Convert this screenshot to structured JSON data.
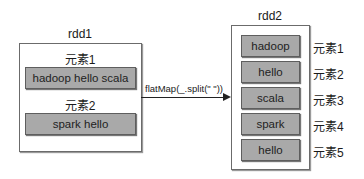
{
  "rdd1": {
    "title": "rdd1",
    "elements": [
      {
        "label": "元素1",
        "value": "hadoop hello scala"
      },
      {
        "label": "元素2",
        "value": "spark hello"
      }
    ]
  },
  "transformation": {
    "label": "flatMap(_.split(\" \"))"
  },
  "rdd2": {
    "title": "rdd2",
    "elements": [
      {
        "label": "元素1",
        "value": "hadoop"
      },
      {
        "label": "元素2",
        "value": "hello"
      },
      {
        "label": "元素3",
        "value": "scala"
      },
      {
        "label": "元素4",
        "value": "spark"
      },
      {
        "label": "元素5",
        "value": "hello"
      }
    ]
  },
  "colors": {
    "cell_fill": "#a9a9a9",
    "border": "#6b6b6b",
    "arrow": "#222222"
  }
}
